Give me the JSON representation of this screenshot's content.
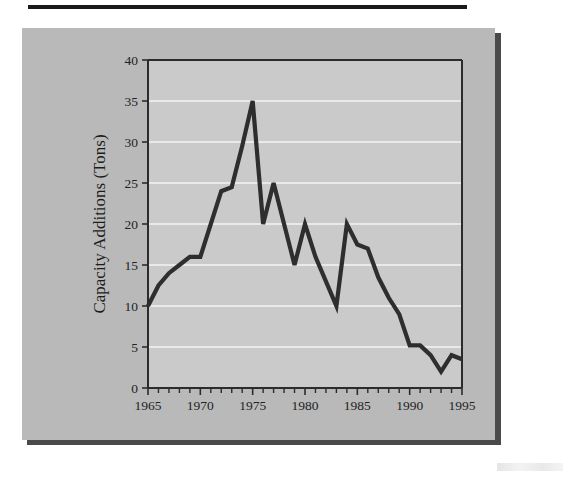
{
  "figure": {
    "panel_color": "#b9b9b9",
    "plot_color": "#cacaca",
    "line_color": "#2e2e2e",
    "gridline_color": "#e9e9e9",
    "axis_color": "#2b2b2b"
  },
  "chart_data": {
    "type": "line",
    "title": "",
    "xlabel": "",
    "ylabel": "Capacity Additions (Tons)",
    "xlim": [
      1965,
      1995
    ],
    "ylim": [
      0,
      40
    ],
    "grid": true,
    "legend": "none",
    "y_ticks": [
      0,
      5,
      10,
      15,
      20,
      25,
      30,
      35,
      40
    ],
    "y_tick_labels": [
      "0",
      "5",
      "10",
      "15",
      "20",
      "25",
      "30",
      "35",
      "40"
    ],
    "x_ticks": [
      1965,
      1966,
      1967,
      1968,
      1969,
      1970,
      1971,
      1972,
      1973,
      1974,
      1975,
      1976,
      1977,
      1978,
      1979,
      1980,
      1981,
      1982,
      1983,
      1984,
      1985,
      1986,
      1987,
      1988,
      1989,
      1990,
      1991,
      1992,
      1993,
      1994,
      1995
    ],
    "x_tick_labels": [
      "1965",
      "1970",
      "1975",
      "1980",
      "1985",
      "1990",
      "1995"
    ],
    "x_labelled_ticks": [
      1965,
      1970,
      1975,
      1980,
      1985,
      1990,
      1995
    ],
    "x": [
      1965,
      1966,
      1967,
      1968,
      1969,
      1970,
      1971,
      1972,
      1973,
      1974,
      1975,
      1976,
      1977,
      1978,
      1979,
      1980,
      1981,
      1982,
      1983,
      1984,
      1985,
      1986,
      1987,
      1988,
      1989,
      1990,
      1991,
      1992,
      1993,
      1994,
      1995
    ],
    "values": [
      10,
      12.5,
      14,
      15,
      16,
      16,
      20,
      24,
      24.5,
      29.5,
      35,
      20,
      25,
      20,
      15,
      20,
      16,
      13,
      10,
      20,
      17.5,
      17,
      13.5,
      11,
      9,
      5.2,
      5.2,
      4,
      2,
      4,
      3.5
    ],
    "series": [
      {
        "name": "Capacity Additions",
        "values": [
          10,
          12.5,
          14,
          15,
          16,
          16,
          20,
          24,
          24.5,
          29.5,
          35,
          20,
          25,
          20,
          15,
          20,
          16,
          13,
          10,
          20,
          17.5,
          17,
          13.5,
          11,
          9,
          5.2,
          5.2,
          4,
          2,
          4,
          3.5
        ]
      }
    ],
    "annotations": {
      "peak_year": 1975,
      "peak_value": 35,
      "start_value": 10,
      "end_value": 3.5,
      "min_value": 2,
      "min_year": 1993
    }
  }
}
